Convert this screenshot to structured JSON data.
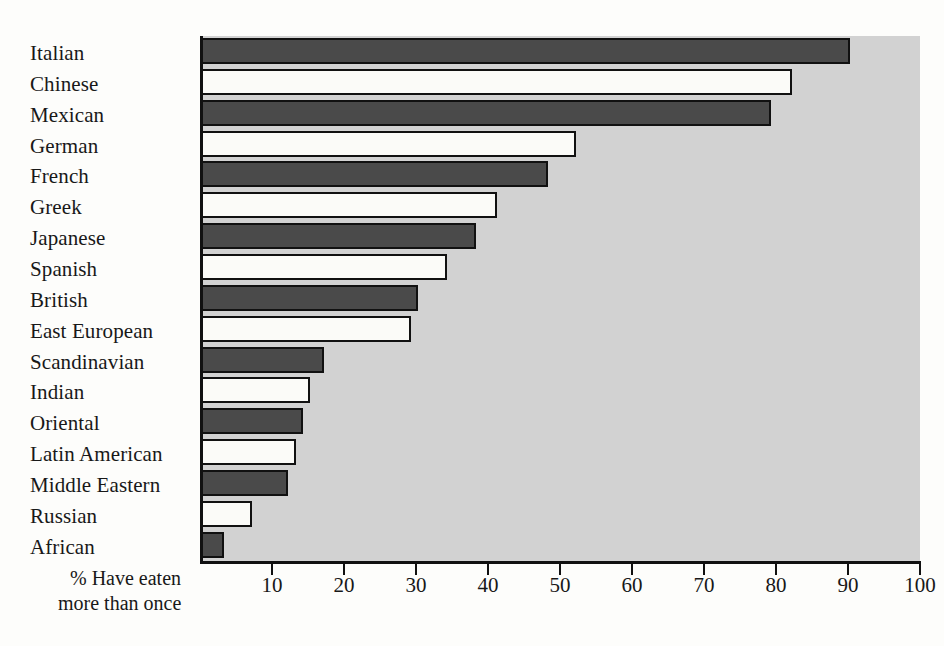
{
  "chart_data": {
    "type": "bar",
    "orientation": "horizontal",
    "title": "",
    "subtitle": "",
    "xlabel": "%  Have eaten more than once",
    "xlabel_line1": "%  Have eaten",
    "xlabel_line2": "more than once",
    "ylabel": "",
    "xlim": [
      0,
      100
    ],
    "xticks": [
      10,
      20,
      30,
      40,
      50,
      60,
      70,
      80,
      90,
      100
    ],
    "xtick_labels": [
      "10",
      "20",
      "30",
      "40",
      "50",
      "60",
      "70",
      "80",
      "90",
      "100"
    ],
    "grid": false,
    "legend": "none",
    "categories": [
      "Italian",
      "Chinese",
      "Mexican",
      "German",
      "French",
      "Greek",
      "Japanese",
      "Spanish",
      "British",
      "East European",
      "Scandinavian",
      "Indian",
      "Oriental",
      "Latin American",
      "Middle Eastern",
      "Russian",
      "African"
    ],
    "values": [
      90,
      82,
      79,
      52,
      48,
      41,
      38,
      34,
      30,
      29,
      17,
      15,
      14,
      13,
      12,
      7,
      3
    ],
    "bar_styles": [
      "dark",
      "light",
      "dark",
      "light",
      "dark",
      "light",
      "dark",
      "light",
      "dark",
      "light",
      "dark",
      "light",
      "dark",
      "light",
      "dark",
      "light",
      "dark"
    ],
    "colors": {
      "dark_bar": "#4a4a4a",
      "light_bar": "#fbfbf8",
      "bar_outline": "#111111",
      "plot_background": "#d2d2d2",
      "page_background": "#fdfdfb",
      "text": "#181818"
    }
  }
}
